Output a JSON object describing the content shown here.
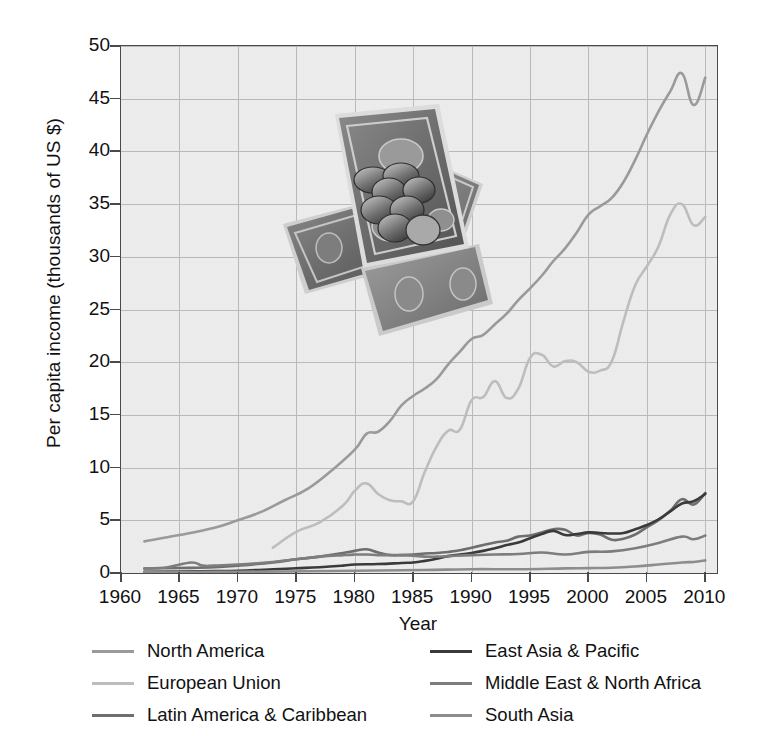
{
  "chart_data": {
    "type": "line",
    "title": "",
    "xlabel": "Year",
    "ylabel": "Per capita income (thousands of US $)",
    "xlim": [
      1960,
      2011
    ],
    "ylim": [
      0,
      50
    ],
    "xticks": [
      1960,
      1965,
      1970,
      1975,
      1980,
      1985,
      1990,
      1995,
      2000,
      2005,
      2010
    ],
    "yticks": [
      0,
      5,
      10,
      15,
      20,
      25,
      30,
      35,
      40,
      45,
      50
    ],
    "grid": true,
    "legend_position": "below-plot, two columns",
    "series": [
      {
        "name": "North America",
        "color": "#9a9a9a",
        "x": [
          1962,
          1965,
          1968,
          1970,
          1972,
          1974,
          1976,
          1978,
          1980,
          1981,
          1982,
          1983,
          1984,
          1985,
          1986,
          1987,
          1988,
          1989,
          1990,
          1991,
          1992,
          1993,
          1994,
          1995,
          1996,
          1997,
          1998,
          1999,
          2000,
          2001,
          2002,
          2003,
          2004,
          2005,
          2006,
          2007,
          2008,
          2009,
          2010
        ],
        "y": [
          3.0,
          3.6,
          4.3,
          5.0,
          5.8,
          6.9,
          8.0,
          9.7,
          11.7,
          13.2,
          13.4,
          14.4,
          15.9,
          16.8,
          17.5,
          18.4,
          19.8,
          21.0,
          22.2,
          22.6,
          23.6,
          24.6,
          25.9,
          27.0,
          28.2,
          29.6,
          30.8,
          32.3,
          34.0,
          34.8,
          35.6,
          37.1,
          39.2,
          41.6,
          43.8,
          45.7,
          47.4,
          44.4,
          47.0
        ]
      },
      {
        "name": "European Union",
        "color": "#bdbdbd",
        "x": [
          1973,
          1975,
          1977,
          1979,
          1980,
          1981,
          1982,
          1983,
          1984,
          1985,
          1986,
          1987,
          1988,
          1989,
          1990,
          1991,
          1992,
          1993,
          1994,
          1995,
          1996,
          1997,
          1998,
          1999,
          2000,
          2001,
          2002,
          2003,
          2004,
          2005,
          2006,
          2007,
          2008,
          2009,
          2010
        ],
        "y": [
          2.4,
          3.9,
          4.8,
          6.4,
          7.8,
          8.5,
          7.5,
          6.9,
          6.8,
          6.8,
          9.6,
          12.0,
          13.5,
          13.6,
          16.4,
          16.7,
          18.2,
          16.6,
          17.5,
          20.4,
          20.7,
          19.6,
          20.1,
          20.0,
          19.1,
          19.2,
          20.1,
          23.9,
          27.3,
          29.1,
          31.0,
          34.0,
          35.0,
          33.0,
          33.8
        ]
      },
      {
        "name": "Latin America & Caribbean",
        "color": "#6e6e6e",
        "x": [
          1962,
          1965,
          1968,
          1970,
          1973,
          1975,
          1977,
          1979,
          1980,
          1981,
          1982,
          1983,
          1984,
          1985,
          1986,
          1987,
          1988,
          1989,
          1990,
          1991,
          1992,
          1993,
          1994,
          1995,
          1996,
          1997,
          1998,
          1999,
          2000,
          2001,
          2002,
          2003,
          2004,
          2005,
          2006,
          2007,
          2008,
          2009,
          2010
        ],
        "y": [
          0.42,
          0.47,
          0.55,
          0.7,
          1.0,
          1.3,
          1.55,
          1.9,
          2.1,
          2.25,
          1.95,
          1.7,
          1.7,
          1.75,
          1.85,
          1.9,
          2.0,
          2.15,
          2.4,
          2.65,
          2.9,
          3.05,
          3.45,
          3.55,
          3.85,
          4.15,
          4.1,
          3.55,
          3.8,
          3.65,
          3.15,
          3.25,
          3.65,
          4.35,
          5.0,
          5.9,
          7.0,
          6.5,
          7.6
        ]
      },
      {
        "name": "East Asia & Pacific",
        "color": "#3a3a3a",
        "x": [
          1962,
          1965,
          1968,
          1970,
          1973,
          1975,
          1977,
          1979,
          1980,
          1982,
          1984,
          1985,
          1986,
          1987,
          1988,
          1989,
          1990,
          1991,
          1992,
          1993,
          1994,
          1995,
          1996,
          1997,
          1998,
          1999,
          2000,
          2001,
          2002,
          2003,
          2004,
          2005,
          2006,
          2007,
          2008,
          2009,
          2010
        ],
        "y": [
          0.12,
          0.14,
          0.18,
          0.22,
          0.35,
          0.45,
          0.55,
          0.7,
          0.8,
          0.85,
          0.95,
          1.0,
          1.15,
          1.35,
          1.6,
          1.75,
          1.9,
          2.1,
          2.35,
          2.65,
          2.9,
          3.3,
          3.7,
          4.0,
          3.6,
          3.7,
          3.85,
          3.8,
          3.75,
          3.8,
          4.15,
          4.55,
          5.1,
          5.85,
          6.6,
          6.8,
          7.5
        ]
      },
      {
        "name": "Middle East & North Africa",
        "color": "#7d7d7d",
        "x": [
          1962,
          1964,
          1966,
          1967,
          1968,
          1970,
          1973,
          1975,
          1977,
          1979,
          1980,
          1981,
          1982,
          1983,
          1984,
          1985,
          1986,
          1987,
          1988,
          1990,
          1992,
          1994,
          1996,
          1998,
          2000,
          2002,
          2004,
          2006,
          2008,
          2009,
          2010
        ],
        "y": [
          0.42,
          0.55,
          1.0,
          0.7,
          0.7,
          0.8,
          1.05,
          1.3,
          1.55,
          1.7,
          1.75,
          1.75,
          1.7,
          1.7,
          1.7,
          1.65,
          1.55,
          1.55,
          1.6,
          1.7,
          1.75,
          1.8,
          1.95,
          1.75,
          2.0,
          2.05,
          2.35,
          2.85,
          3.45,
          3.2,
          3.55
        ]
      },
      {
        "name": "South Asia",
        "color": "#8d8d8d",
        "x": [
          1962,
          1966,
          1970,
          1974,
          1978,
          1982,
          1986,
          1990,
          1994,
          1998,
          2000,
          2002,
          2004,
          2006,
          2008,
          2009,
          2010
        ],
        "y": [
          0.09,
          0.1,
          0.12,
          0.14,
          0.19,
          0.24,
          0.29,
          0.36,
          0.36,
          0.44,
          0.46,
          0.5,
          0.62,
          0.8,
          1.0,
          1.05,
          1.2
        ]
      }
    ]
  },
  "legend": {
    "entries": [
      {
        "label": "North America",
        "color": "#9a9a9a",
        "column": "left",
        "row": 0
      },
      {
        "label": "European Union",
        "color": "#bdbdbd",
        "column": "left",
        "row": 1
      },
      {
        "label": "Latin America & Caribbean",
        "color": "#6e6e6e",
        "column": "left",
        "row": 2
      },
      {
        "label": "East Asia & Pacific",
        "color": "#3a3a3a",
        "column": "right",
        "row": 0
      },
      {
        "label": "Middle East & North Africa",
        "color": "#7d7d7d",
        "column": "right",
        "row": 1
      },
      {
        "label": "South Asia",
        "color": "#8d8d8d",
        "column": "right",
        "row": 2
      }
    ]
  },
  "overlay_image": {
    "name": "us-currency-photo",
    "description": "Grayscale photograph of US dollar banknotes and coins"
  },
  "colors": {
    "plot_background": "#eeeeee",
    "grid": "#b9b9b9",
    "axis": "#4a4a4a",
    "text": "#111111",
    "page_background": "#ffffff"
  }
}
